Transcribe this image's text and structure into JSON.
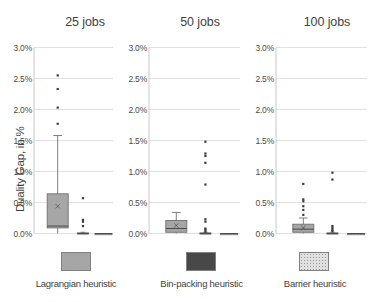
{
  "chart_data": {
    "type": "box",
    "title": "",
    "ylabel": "Duality Gap, in %",
    "ylim": [
      0.0,
      3.0
    ],
    "ytick_labels": [
      "3.0%",
      "2.5%",
      "2.0%",
      "1.5%",
      "1.0%",
      "0.5%",
      "0.0%"
    ],
    "ytick_values": [
      3.0,
      2.5,
      2.0,
      1.5,
      1.0,
      0.5,
      0.0
    ],
    "grid": true,
    "legend_position": "bottom",
    "colors": {
      "lagrangian": "#a6a6a6",
      "binpacking": "#484848",
      "barrier": "#cfcfcf",
      "outline": "#6f6f6f",
      "gridline": "#d9d9d9",
      "text": "#3f3f3f"
    },
    "panels": [
      {
        "title": "25 jobs",
        "series": [
          {
            "name": "Lagrangian heuristic",
            "q1": 0.09,
            "median": 0.12,
            "q3": 0.64,
            "mean": 0.44,
            "whisker_low": 0.0,
            "whisker_high": 1.58,
            "outliers": [
              1.77,
              2.03,
              2.33,
              2.55
            ]
          },
          {
            "name": "Bin-packing heuristic",
            "q1": 0.0,
            "median": 0.0,
            "q3": 0.01,
            "mean": 0.01,
            "whisker_low": 0.0,
            "whisker_high": 0.02,
            "outliers": [
              0.12,
              0.19,
              0.22,
              0.57
            ]
          },
          {
            "name": "Barrier heuristic",
            "q1": 0.0,
            "median": 0.0,
            "q3": 0.0,
            "mean": 0.0,
            "whisker_low": 0.0,
            "whisker_high": 0.0,
            "outliers": []
          }
        ]
      },
      {
        "title": "50 jobs",
        "series": [
          {
            "name": "Lagrangian heuristic",
            "q1": 0.02,
            "median": 0.08,
            "q3": 0.21,
            "mean": 0.13,
            "whisker_low": 0.0,
            "whisker_high": 0.34,
            "outliers": []
          },
          {
            "name": "Bin-packing heuristic",
            "q1": 0.0,
            "median": 0.0,
            "q3": 0.01,
            "mean": 0.01,
            "whisker_low": 0.0,
            "whisker_high": 0.02,
            "outliers": [
              0.03,
              0.06,
              0.08,
              0.19,
              0.23,
              0.79,
              1.14,
              1.25,
              1.29,
              1.48
            ]
          },
          {
            "name": "Barrier heuristic",
            "q1": 0.0,
            "median": 0.0,
            "q3": 0.0,
            "mean": 0.0,
            "whisker_low": 0.0,
            "whisker_high": 0.0,
            "outliers": []
          }
        ]
      },
      {
        "title": "100 jobs",
        "series": [
          {
            "name": "Lagrangian heuristic",
            "q1": 0.02,
            "median": 0.07,
            "q3": 0.15,
            "mean": 0.09,
            "whisker_low": 0.0,
            "whisker_high": 0.25,
            "outliers": [
              0.3,
              0.38,
              0.44,
              0.52,
              0.55,
              0.8
            ]
          },
          {
            "name": "Bin-packing heuristic",
            "q1": 0.0,
            "median": 0.0,
            "q3": 0.01,
            "mean": 0.01,
            "whisker_low": 0.0,
            "whisker_high": 0.02,
            "outliers": [
              0.04,
              0.06,
              0.09,
              0.12,
              0.87,
              0.98
            ]
          },
          {
            "name": "Barrier heuristic",
            "q1": 0.0,
            "median": 0.0,
            "q3": 0.0,
            "mean": 0.0,
            "whisker_low": 0.0,
            "whisker_high": 0.0,
            "outliers": []
          }
        ]
      }
    ],
    "legend": [
      {
        "label": "Lagrangian heuristic",
        "fill": "#a6a6a6",
        "pattern": "solid"
      },
      {
        "label": "Bin-packing heuristic",
        "fill": "#484848",
        "pattern": "solid"
      },
      {
        "label": "Barrier heuristic",
        "fill": "#d5d5d5",
        "pattern": "dotted"
      }
    ]
  },
  "axis": {
    "ylabel": "Duality Gap, in %",
    "ticks": [
      "3.0%",
      "2.5%",
      "2.0%",
      "1.5%",
      "1.0%",
      "0.5%",
      "0.0%"
    ]
  },
  "panel_titles": [
    "25 jobs",
    "50 jobs",
    "100 jobs"
  ],
  "legend_labels": [
    "Lagrangian heuristic",
    "Bin-packing heuristic",
    "Barrier heuristic"
  ]
}
